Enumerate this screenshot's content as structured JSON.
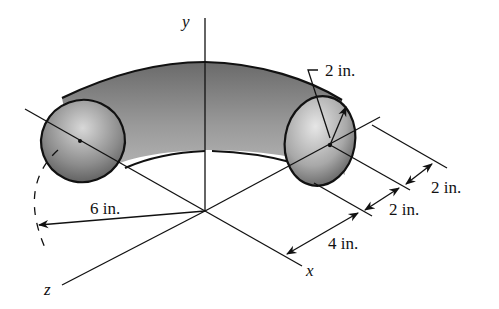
{
  "figure": {
    "type": "engineering-diagram",
    "axes": {
      "x": "x",
      "y": "y",
      "z": "z"
    },
    "dimensions": {
      "tube_radius": "2 in.",
      "bend_radius": "6 in.",
      "offset_1": "2 in.",
      "offset_2": "2 in.",
      "offset_3": "4 in."
    }
  }
}
